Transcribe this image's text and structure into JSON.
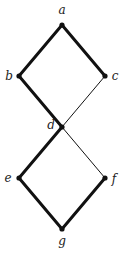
{
  "diagram": {
    "type": "hasse-diagram",
    "nodes": [
      {
        "id": "a",
        "label": "a",
        "x": 62,
        "y": 25,
        "lx": 62,
        "ly": 14,
        "anchor": "middle"
      },
      {
        "id": "b",
        "label": "b",
        "x": 19,
        "y": 76,
        "lx": 9,
        "ly": 80,
        "anchor": "middle"
      },
      {
        "id": "c",
        "label": "c",
        "x": 105,
        "y": 76,
        "lx": 115,
        "ly": 80,
        "anchor": "middle"
      },
      {
        "id": "d",
        "label": "d",
        "x": 62,
        "y": 127,
        "lx": 51,
        "ly": 129,
        "anchor": "middle"
      },
      {
        "id": "e",
        "label": "e",
        "x": 19,
        "y": 178,
        "lx": 8,
        "ly": 182,
        "anchor": "middle"
      },
      {
        "id": "f",
        "label": "f",
        "x": 105,
        "y": 178,
        "lx": 114,
        "ly": 183,
        "anchor": "middle"
      },
      {
        "id": "g",
        "label": "g",
        "x": 62,
        "y": 229,
        "lx": 62,
        "ly": 245,
        "anchor": "middle"
      }
    ],
    "edges": [
      {
        "from": "a",
        "to": "b",
        "weight": "thick"
      },
      {
        "from": "a",
        "to": "c",
        "weight": "thick"
      },
      {
        "from": "b",
        "to": "d",
        "weight": "thick"
      },
      {
        "from": "c",
        "to": "d",
        "weight": "thin"
      },
      {
        "from": "d",
        "to": "e",
        "weight": "thick"
      },
      {
        "from": "d",
        "to": "f",
        "weight": "thin"
      },
      {
        "from": "e",
        "to": "g",
        "weight": "thick"
      },
      {
        "from": "f",
        "to": "g",
        "weight": "thick"
      }
    ],
    "colors": {
      "line": "#111111",
      "node": "#111111",
      "label": "#222222"
    }
  }
}
